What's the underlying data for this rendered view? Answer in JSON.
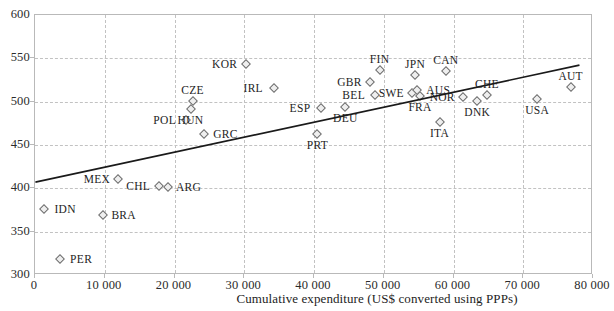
{
  "chart_data": {
    "type": "scatter",
    "title": "",
    "xlabel": "Cumulative expenditure (US$ converted using PPPs)",
    "ylabel": "",
    "xlim": [
      0,
      80000
    ],
    "ylim": [
      300,
      600
    ],
    "grid": true,
    "legend": "none",
    "xticks": [
      "0",
      "10 000",
      "20 000",
      "30 000",
      "40 000",
      "50 000",
      "60 000",
      "70 000",
      "80 000"
    ],
    "xtick_values": [
      0,
      10000,
      20000,
      30000,
      40000,
      50000,
      60000,
      70000,
      80000
    ],
    "yticks": [
      "300",
      "350",
      "400",
      "450",
      "500",
      "550",
      "600"
    ],
    "ytick_values": [
      300,
      350,
      400,
      450,
      500,
      550,
      600
    ],
    "points": [
      {
        "code": "IDN",
        "x": 1300,
        "y": 376,
        "label_pos": "right"
      },
      {
        "code": "PER",
        "x": 3600,
        "y": 318,
        "label_pos": "right"
      },
      {
        "code": "BRA",
        "x": 9700,
        "y": 369,
        "label_pos": "right"
      },
      {
        "code": "MEX",
        "x": 11900,
        "y": 411,
        "label_pos": "left"
      },
      {
        "code": "CHL",
        "x": 17800,
        "y": 403,
        "label_pos": "left"
      },
      {
        "code": "ARG",
        "x": 19000,
        "y": 401,
        "label_pos": "right"
      },
      {
        "code": "POL",
        "x": 21600,
        "y": 479,
        "label_pos": "left"
      },
      {
        "code": "HUN",
        "x": 22300,
        "y": 491,
        "label_pos": "below"
      },
      {
        "code": "CZE",
        "x": 22600,
        "y": 501,
        "label_pos": "above"
      },
      {
        "code": "GRC",
        "x": 24300,
        "y": 463,
        "label_pos": "right"
      },
      {
        "code": "KOR",
        "x": 30200,
        "y": 544,
        "label_pos": "left"
      },
      {
        "code": "IRL",
        "x": 34300,
        "y": 516,
        "label_pos": "left"
      },
      {
        "code": "PRT",
        "x": 40500,
        "y": 463,
        "label_pos": "below"
      },
      {
        "code": "ESP",
        "x": 41000,
        "y": 493,
        "label_pos": "left"
      },
      {
        "code": "DEU",
        "x": 44500,
        "y": 494,
        "label_pos": "below"
      },
      {
        "code": "GBR",
        "x": 48100,
        "y": 523,
        "label_pos": "left"
      },
      {
        "code": "BEL",
        "x": 48700,
        "y": 508,
        "label_pos": "left"
      },
      {
        "code": "FIN",
        "x": 49400,
        "y": 536,
        "label_pos": "above"
      },
      {
        "code": "SWE",
        "x": 54100,
        "y": 510,
        "label_pos": "left"
      },
      {
        "code": "JPN",
        "x": 54500,
        "y": 531,
        "label_pos": "above"
      },
      {
        "code": "AUS",
        "x": 54800,
        "y": 514,
        "label_pos": "right"
      },
      {
        "code": "FRA",
        "x": 55200,
        "y": 506,
        "label_pos": "below"
      },
      {
        "code": "ITA",
        "x": 58000,
        "y": 477,
        "label_pos": "below"
      },
      {
        "code": "CAN",
        "x": 58900,
        "y": 535,
        "label_pos": "above"
      },
      {
        "code": "NOR",
        "x": 61400,
        "y": 505,
        "label_pos": "left"
      },
      {
        "code": "DNK",
        "x": 63400,
        "y": 501,
        "label_pos": "below"
      },
      {
        "code": "CHE",
        "x": 64800,
        "y": 508,
        "label_pos": "above"
      },
      {
        "code": "USA",
        "x": 72000,
        "y": 503,
        "label_pos": "below"
      },
      {
        "code": "AUT",
        "x": 76800,
        "y": 517,
        "label_pos": "above"
      }
    ],
    "trendline": {
      "x0": 200,
      "y0": 406,
      "x1": 78200,
      "y1": 541,
      "style": "solid",
      "color": "#1a1a1a"
    },
    "colors": {
      "marker_fill": "#efefef",
      "marker_edge": "#6f6f6f",
      "grid": "#c2c2c2",
      "frame": "#b9b9b9",
      "text": "#1d1d1d",
      "trendline": "#1a1a1a"
    }
  }
}
